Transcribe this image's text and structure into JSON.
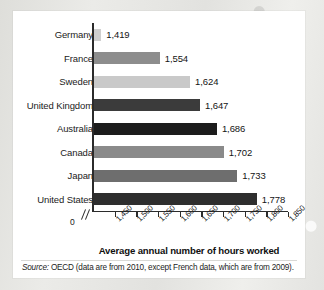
{
  "chart_data": {
    "type": "bar",
    "orientation": "horizontal",
    "title": "",
    "xlabel": "Average annual number of hours worked",
    "ylabel": "",
    "categories": [
      "Germany",
      "France",
      "Sweden",
      "United Kingdom",
      "Australia",
      "Canada",
      "Japan",
      "United States"
    ],
    "values": [
      1419,
      1554,
      1624,
      1647,
      1686,
      1702,
      1733,
      1778
    ],
    "value_labels": [
      "1,419",
      "1,554",
      "1,624",
      "1,647",
      "1,686",
      "1,702",
      "1,733",
      "1,778"
    ],
    "bar_colors": [
      "#cfcfcf",
      "#8d8d8d",
      "#c9c9c9",
      "#3b3b3b",
      "#1c1c1c",
      "#8a8a8a",
      "#6e6e6e",
      "#2e2e2e"
    ],
    "xlim": [
      1400,
      1850
    ],
    "axis_break": true,
    "zero_label": "0",
    "xticks": [
      1450,
      1500,
      1550,
      1600,
      1650,
      1700,
      1750,
      1800,
      1850
    ],
    "xtick_labels": [
      "1,450",
      "1,500",
      "1,550",
      "1,600",
      "1,650",
      "1,700",
      "1,750",
      "1,800",
      "1,850"
    ],
    "grid": false,
    "legend": null,
    "source_prefix": "Source:",
    "source_text": " OECD (data are from 2010, except French data, which are from 2009)."
  },
  "colors": {
    "axis": "#2b2b2b",
    "text": "#1b1b1b",
    "card": "#ffffff",
    "backdrop": "#e9e9e7"
  }
}
